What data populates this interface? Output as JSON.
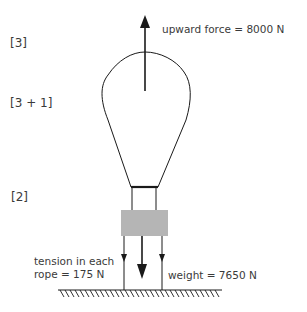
{
  "diagram": {
    "marks": [
      {
        "id": "mark-1",
        "text": "[3]"
      },
      {
        "id": "mark-2",
        "text": "[3 + 1]"
      },
      {
        "id": "mark-3",
        "text": "[2]"
      }
    ],
    "forces": {
      "upward": {
        "label": "upward force = 8000 N",
        "value": 8000,
        "unit": "N",
        "direction": "up"
      },
      "tension": {
        "label_line1": "tension in each",
        "label_line2": "rope = 175 N",
        "value": 175,
        "unit": "N",
        "direction": "down"
      },
      "weight": {
        "label": "weight = 7650 N",
        "value": 7650,
        "unit": "N",
        "direction": "down"
      }
    },
    "colors": {
      "line": "#1a1a1a",
      "basket": "#b5b5b5",
      "text": "#3a3a3a"
    }
  }
}
